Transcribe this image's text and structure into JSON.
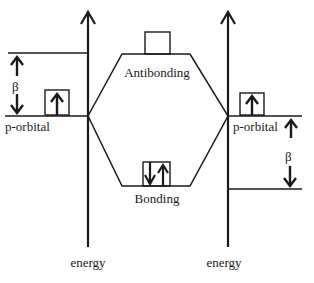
{
  "diagram": {
    "type": "molecular-orbital-energy-diagram",
    "left_axis": {
      "label": "energy"
    },
    "right_axis": {
      "label": "energy"
    },
    "left_atom": {
      "orbital_label": "p-orbital",
      "electrons": [
        "up"
      ],
      "beta_label": "β"
    },
    "right_atom": {
      "orbital_label": "p-orbital",
      "electrons": [
        "up"
      ],
      "beta_label": "β"
    },
    "molecular_orbitals": [
      {
        "name": "antibonding",
        "label": "Antibonding",
        "electrons": []
      },
      {
        "name": "bonding",
        "label": "Bonding",
        "electrons": [
          "down",
          "up"
        ]
      }
    ],
    "colors": {
      "line": "#1a1a1a",
      "background": "#ffffff"
    }
  }
}
